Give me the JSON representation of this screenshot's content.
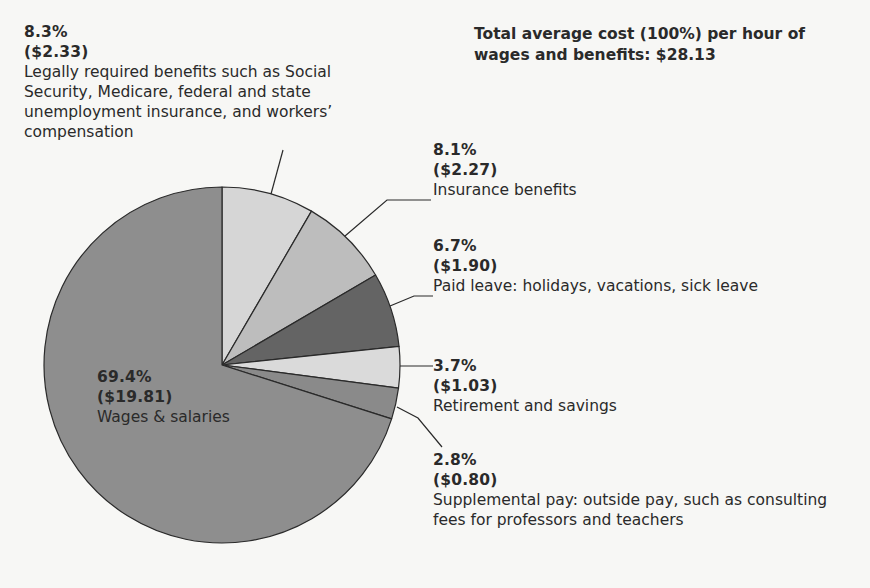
{
  "title": "Total average cost (100%) per hour of wages and benefits: $28.13",
  "labels": {
    "legal": {
      "pct": "8.3%",
      "amt": "($2.33)",
      "desc": "Legally required benefits such as Social Security, Medicare, federal and state unemployment insurance, and workers’ compensation"
    },
    "insurance": {
      "pct": "8.1%",
      "amt": "($2.27)",
      "desc": "Insurance benefits"
    },
    "paid_leave": {
      "pct": "6.7%",
      "amt": "($1.90)",
      "desc": "Paid leave: holidays, vacations, sick leave"
    },
    "retirement": {
      "pct": "3.7%",
      "amt": "($1.03)",
      "desc": "Retirement and savings"
    },
    "supplemental": {
      "pct": "2.8%",
      "amt": "($0.80)",
      "desc": "Supplemental pay: outside pay, such as consulting fees for professors and teachers"
    },
    "wages": {
      "pct": "69.4%",
      "amt": "($19.81)",
      "desc": "Wages & salaries"
    }
  },
  "colors": {
    "legal": "#d6d6d6",
    "insurance": "#bdbdbd",
    "paid_leave": "#646464",
    "retirement": "#dadada",
    "supplemental": "#8a8a8a",
    "wages": "#8e8e8e",
    "stroke": "#2a2a2a"
  },
  "chart_data": {
    "type": "pie",
    "title": "Total average cost (100%) per hour of wages and benefits: $28.13",
    "total": 28.13,
    "start_angle": "12 o'clock, clockwise",
    "categories": [
      "Legally required benefits such as Social Security, Medicare, federal and state unemployment insurance, and workers’ compensation",
      "Insurance benefits",
      "Paid leave: holidays, vacations, sick leave",
      "Retirement and savings",
      "Supplemental pay: outside pay, such as consulting fees for professors and teachers",
      "Wages & salaries"
    ],
    "values": [
      8.3,
      8.1,
      6.7,
      3.7,
      2.8,
      69.4
    ],
    "dollar_values": [
      2.33,
      2.27,
      1.9,
      1.03,
      0.8,
      19.81
    ],
    "legend": "none (direct labels with leader lines)"
  }
}
